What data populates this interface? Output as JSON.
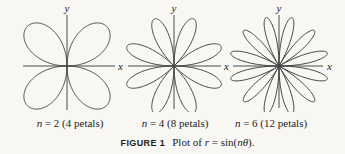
{
  "figure": {
    "caption": {
      "tag": "FIGURE 1",
      "parts": [
        "Plot of ",
        "r",
        " = sin(",
        "n",
        "θ",
        ")."
      ]
    },
    "panels": [
      {
        "var": "n",
        "label_rest": " = 2 (4 petals)",
        "x_axis_label": "x",
        "y_axis_label": "y"
      },
      {
        "var": "n",
        "label_rest": " = 4 (8 petals)",
        "x_axis_label": "x",
        "y_axis_label": "y"
      },
      {
        "var": "n",
        "label_rest": " = 6 (12 petals)",
        "x_axis_label": "x",
        "y_axis_label": "y"
      }
    ]
  },
  "colors": {
    "background": "#f8f7f4",
    "axis": "#4a4a4a",
    "curve": "#454545",
    "text": "#1d1d1d"
  },
  "chart_data": [
    {
      "type": "line",
      "coordinate_system": "polar",
      "equation": "r = sin(2θ)",
      "n": 2,
      "petals": 4,
      "petal_angles_deg": [
        45,
        135,
        225,
        315
      ],
      "r_range": [
        -1,
        1
      ],
      "theta_range_deg": [
        0,
        360
      ],
      "xlabel": "x",
      "ylabel": "y",
      "grid": false,
      "label": "n = 2 (4 petals)"
    },
    {
      "type": "line",
      "coordinate_system": "polar",
      "equation": "r = sin(4θ)",
      "n": 4,
      "petals": 8,
      "petal_angles_deg": [
        22.5,
        67.5,
        112.5,
        157.5,
        202.5,
        247.5,
        292.5,
        337.5
      ],
      "r_range": [
        -1,
        1
      ],
      "theta_range_deg": [
        0,
        360
      ],
      "xlabel": "x",
      "ylabel": "y",
      "grid": false,
      "label": "n = 4 (8 petals)"
    },
    {
      "type": "line",
      "coordinate_system": "polar",
      "equation": "r = sin(6θ)",
      "n": 6,
      "petals": 12,
      "petal_angles_deg": [
        15,
        45,
        75,
        105,
        135,
        165,
        195,
        225,
        255,
        285,
        315,
        345
      ],
      "r_range": [
        -1,
        1
      ],
      "theta_range_deg": [
        0,
        360
      ],
      "xlabel": "x",
      "ylabel": "y",
      "grid": false,
      "label": "n = 6 (12 petals)"
    }
  ]
}
